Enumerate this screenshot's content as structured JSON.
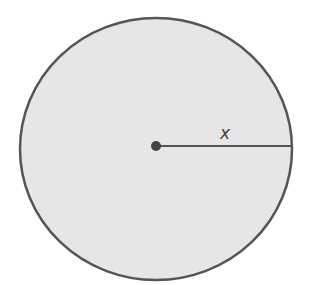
{
  "diagram": {
    "type": "circle-radius",
    "shape": "circle",
    "center_point": {
      "x": 156,
      "y": 146
    },
    "radius_label": "x",
    "colors": {
      "fill": "#e6e6e6",
      "stroke": "#555555",
      "background": "#ffffff"
    }
  }
}
